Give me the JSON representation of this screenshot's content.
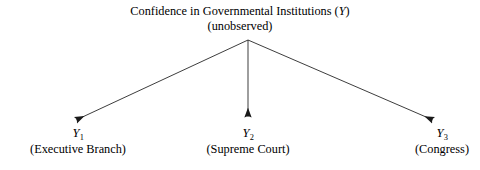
{
  "diagram": {
    "type": "path-diagram",
    "background_color": "#ffffff",
    "line_color": "#1a1a1a",
    "latent": {
      "title_prefix": "Confidence in Governmental Institutions (",
      "title_variable": "Y",
      "title_suffix": ")",
      "status": "(unobserved)"
    },
    "indicators": [
      {
        "symbol": "Y",
        "subscript": "1",
        "label": "(Executive Branch)"
      },
      {
        "symbol": "Y",
        "subscript": "2",
        "label": "(Supreme Court)"
      },
      {
        "symbol": "Y",
        "subscript": "3",
        "label": "(Congress)"
      }
    ],
    "arrows": [
      {
        "name": "arrow-to-y1",
        "from_x": 248,
        "from_y": 40,
        "to_x": 76,
        "to_y": 120
      },
      {
        "name": "arrow-to-y2",
        "from_x": 248,
        "from_y": 40,
        "to_x": 248,
        "to_y": 117
      },
      {
        "name": "arrow-to-y3",
        "from_x": 248,
        "from_y": 40,
        "to_x": 433,
        "to_y": 120
      }
    ]
  }
}
